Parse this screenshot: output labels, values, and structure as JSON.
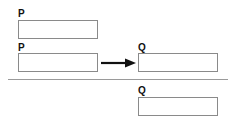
{
  "diagram": {
    "premise1": {
      "label": "P"
    },
    "premise2": {
      "label": "P",
      "arrow": "right-arrow",
      "target_label": "Q"
    },
    "conclusion": {
      "label": "Q"
    }
  },
  "colors": {
    "box_border": "#8a8a8a",
    "text": "#111111",
    "arrow": "#111111",
    "rule": "#9a9a9a"
  }
}
